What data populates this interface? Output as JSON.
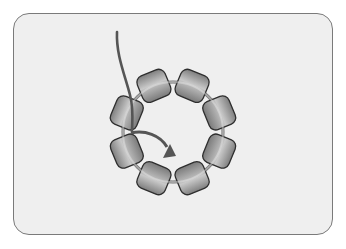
{
  "diagram": {
    "bead_count": 8,
    "ring": {
      "cx": 173,
      "cy": 132,
      "r": 50,
      "color": "#6f6f6f"
    },
    "bead": {
      "width": 30,
      "height": 28,
      "corner_radius": 7,
      "stroke": "#2e2e2e",
      "light": "#d8d8d8",
      "mid": "#a8a8a8",
      "dark": "#7a7a7a"
    },
    "beads": [
      {
        "id": "bead-1",
        "angle": -112.5
      },
      {
        "id": "bead-2",
        "angle": -67.5
      },
      {
        "id": "bead-3",
        "angle": -22.5
      },
      {
        "id": "bead-4",
        "angle": 22.5
      },
      {
        "id": "bead-5",
        "angle": 67.5
      },
      {
        "id": "bead-6",
        "angle": 112.5
      },
      {
        "id": "bead-7",
        "angle": 157.5
      },
      {
        "id": "bead-8",
        "angle": -157.5
      }
    ],
    "thread": {
      "color": "#555555",
      "path": "M117 32 C 116 55, 125 75, 130 95 C 134 110, 132 125, 132 132"
    },
    "arrow": {
      "color": "#555555",
      "path": "M131 133 C 145 130, 160 135, 167 147",
      "head": "163,158 176,156 170,144"
    },
    "card": {
      "background": "#efefef",
      "border": "#7a7a7a"
    }
  }
}
